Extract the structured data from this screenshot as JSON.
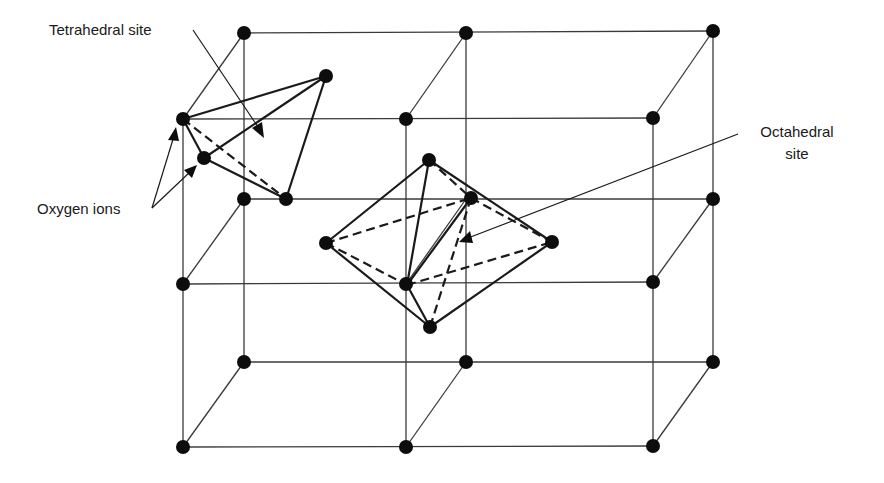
{
  "figure": {
    "labels": {
      "tetrahedral": "Tetrahedral site",
      "octahedral_line1": "Octahedral",
      "octahedral_line2": "site",
      "oxygen": "Oxygen ions"
    },
    "colors": {
      "ink": "#1a1a1a",
      "lattice": "#3a3a3a",
      "background": "#ffffff"
    }
  },
  "lattice": {
    "front_nodes": [
      [
        183,
        119
      ],
      [
        406,
        119
      ],
      [
        653,
        118
      ],
      [
        183,
        284
      ],
      [
        406,
        284
      ],
      [
        653,
        282
      ],
      [
        183,
        447
      ],
      [
        406,
        447
      ],
      [
        653,
        446
      ]
    ],
    "back_nodes": [
      [
        244,
        33
      ],
      [
        466,
        33
      ],
      [
        713,
        31
      ],
      [
        244,
        199
      ],
      [
        466,
        199
      ],
      [
        713,
        199
      ],
      [
        244,
        362
      ],
      [
        466,
        362
      ],
      [
        713,
        362
      ]
    ]
  },
  "tetrahedron": {
    "vertices": {
      "A": [
        183,
        119
      ],
      "B": [
        326,
        76
      ],
      "C": [
        204,
        158
      ],
      "D": [
        286,
        199
      ]
    },
    "solid_edges": [
      [
        "A",
        "B"
      ],
      [
        "A",
        "C"
      ],
      [
        "B",
        "C"
      ],
      [
        "B",
        "D"
      ],
      [
        "C",
        "D"
      ]
    ],
    "dashed_edges": [
      [
        "A",
        "D"
      ]
    ]
  },
  "octahedron": {
    "vertices": {
      "top": [
        429,
        160
      ],
      "left": [
        326,
        243
      ],
      "right": [
        552,
        242
      ],
      "back": [
        471,
        198
      ],
      "front": [
        407,
        285
      ],
      "bottom": [
        430,
        327
      ]
    },
    "solid_edges": [
      [
        "top",
        "left"
      ],
      [
        "top",
        "right"
      ],
      [
        "top",
        "front"
      ],
      [
        "left",
        "bottom"
      ],
      [
        "right",
        "bottom"
      ],
      [
        "front",
        "bottom"
      ],
      [
        "front",
        "back"
      ]
    ],
    "dashed_edges": [
      [
        "top",
        "back"
      ],
      [
        "back",
        "right"
      ],
      [
        "left",
        "back"
      ],
      [
        "left",
        "front"
      ],
      [
        "front",
        "right"
      ],
      [
        "back",
        "bottom"
      ]
    ]
  }
}
